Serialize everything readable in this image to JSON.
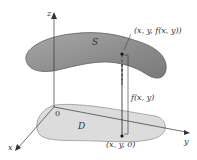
{
  "figure": {
    "type": "3d surface over region diagram",
    "axes": {
      "z_label": "z",
      "y_label": "y",
      "x_label": "x",
      "origin_label": "0"
    },
    "surface": {
      "label": "S",
      "fill": "#8c8c8c"
    },
    "region": {
      "label": "D",
      "fill": "#d9d9d9"
    },
    "points": {
      "top_point_label": "(x, y, f(x, y))",
      "bottom_point_label": "(x, y, 0)",
      "height_label": "f(x, y)"
    },
    "colors": {
      "axis": "#333333",
      "surface_edge": "#555555",
      "region_edge": "#888888"
    }
  }
}
